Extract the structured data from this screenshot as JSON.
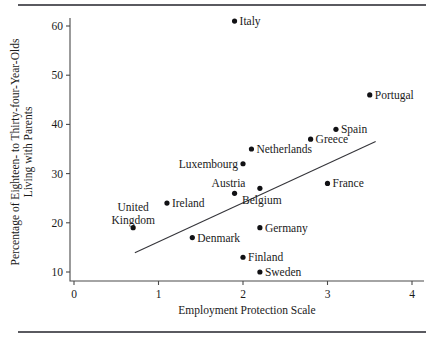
{
  "figure": {
    "name": "scatter-plot-employment-protection-vs-living-with-parents",
    "top_rule": "",
    "bottom_rule": ""
  },
  "chart_data": {
    "type": "scatter",
    "title": "",
    "xlabel": "Employment Protection Scale",
    "ylabel": "Percentage of Eighteen- to Thirty-four-Year-Olds Living with Parents",
    "ylabel_line1": "Percentage of Eighteen- to Thirty-four-Year-Olds",
    "ylabel_line2": "Living with Parents",
    "xlim": [
      0,
      4
    ],
    "ylim": [
      8,
      63
    ],
    "xticks": [
      0,
      1,
      2,
      3,
      4
    ],
    "xtick_labels": [
      "0",
      "1",
      "2",
      "3",
      "4"
    ],
    "yticks": [
      10,
      20,
      30,
      40,
      50,
      60
    ],
    "ytick_labels": [
      "10",
      "20",
      "30",
      "40",
      "50",
      "60"
    ],
    "grid": false,
    "legend": "none",
    "marker_color": "#111114",
    "line_color": "#35353a",
    "axis_color": "#4a4a4a",
    "points": [
      {
        "label": "Italy",
        "x": 1.9,
        "y": 61,
        "label_pos": "right"
      },
      {
        "label": "Portugal",
        "x": 3.5,
        "y": 46,
        "label_pos": "right"
      },
      {
        "label": "Spain",
        "x": 3.1,
        "y": 39,
        "label_pos": "right"
      },
      {
        "label": "Greece",
        "x": 2.8,
        "y": 37,
        "label_pos": "right"
      },
      {
        "label": "Netherlands",
        "x": 2.1,
        "y": 35,
        "label_pos": "right"
      },
      {
        "label": "Luxembourg",
        "x": 2.0,
        "y": 32,
        "label_pos": "left"
      },
      {
        "label": "France",
        "x": 3.0,
        "y": 28,
        "label_pos": "right"
      },
      {
        "label": "Belgium",
        "x": 2.2,
        "y": 27,
        "label_pos": "below"
      },
      {
        "label": "Austria",
        "x": 1.9,
        "y": 26,
        "label_pos": "above"
      },
      {
        "label": "Ireland",
        "x": 1.1,
        "y": 24,
        "label_pos": "right"
      },
      {
        "label": "United Kingdom",
        "x": 0.7,
        "y": 19,
        "label_pos": "above"
      },
      {
        "label": "Germany",
        "x": 2.2,
        "y": 19,
        "label_pos": "right"
      },
      {
        "label": "Denmark",
        "x": 1.4,
        "y": 17,
        "label_pos": "right"
      },
      {
        "label": "Finland",
        "x": 2.0,
        "y": 13,
        "label_pos": "right"
      },
      {
        "label": "Sweden",
        "x": 2.2,
        "y": 10,
        "label_pos": "right"
      }
    ],
    "fit_line": {
      "x0": 0.72,
      "y0": 13.9,
      "x1": 3.57,
      "y1": 36.5
    }
  }
}
